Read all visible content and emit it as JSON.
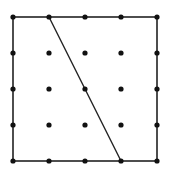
{
  "diagram": {
    "type": "geoboard",
    "grid": {
      "columns": 5,
      "rows": 5,
      "x_positions": [
        13,
        49,
        85,
        121,
        157
      ],
      "y_positions": [
        17,
        53,
        89,
        125,
        161
      ],
      "dot_radius": 2.6,
      "dot_color": "#111111"
    },
    "square": {
      "x": 13,
      "y": 17,
      "width": 144,
      "height": 144,
      "stroke": "#222222",
      "stroke_width": 1.6
    },
    "segment": {
      "from": {
        "col": 1,
        "row": 0
      },
      "to": {
        "col": 3,
        "row": 4
      },
      "stroke": "#222222",
      "stroke_width": 1.4
    },
    "background": "#ffffff"
  }
}
